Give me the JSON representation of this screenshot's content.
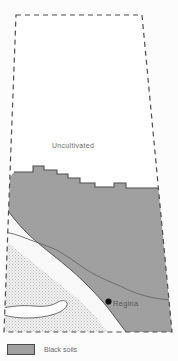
{
  "figure": {
    "type": "thematic-map",
    "width": 178,
    "height": 361
  },
  "map": {
    "boundary_style": "dashed",
    "boundary_color": "#4d4d4d",
    "labels": [
      {
        "id": "uncultivated",
        "text": "Uncultivated"
      }
    ],
    "cities": [
      {
        "id": "regina",
        "name": "Regina",
        "marker": "filled-circle"
      }
    ],
    "zones": [
      {
        "id": "uncultivated-zone",
        "name": "Uncultivated",
        "fill": "#ffffff"
      },
      {
        "id": "dark-gray-zone",
        "name": "Black soils",
        "fill": "#a0a0a0"
      },
      {
        "id": "white-zone",
        "name": "Dark brown soils",
        "fill": "#f7f7f7"
      },
      {
        "id": "stipple-zone",
        "name": "Brown soils",
        "fill": "#dcdcdc"
      }
    ],
    "water": [
      {
        "id": "lake",
        "name": "lake",
        "fill": "#ffffff"
      }
    ]
  },
  "legend": {
    "items": [
      {
        "id": "black-soils",
        "label": "Black soils",
        "swatch_color": "#a0a0a0"
      }
    ]
  }
}
